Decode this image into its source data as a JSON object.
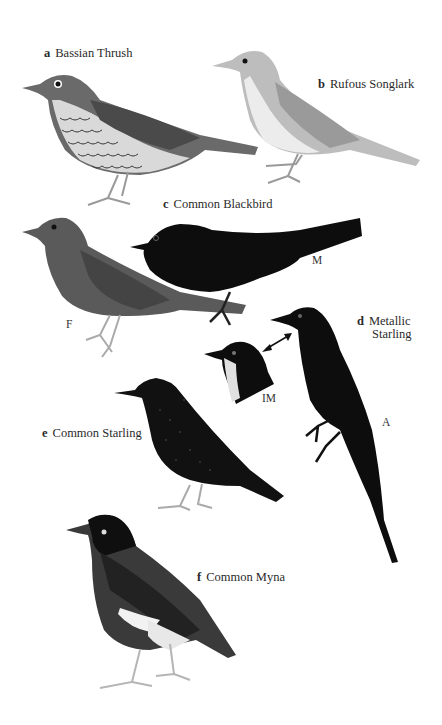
{
  "plate": {
    "species": [
      {
        "letter": "a",
        "name": "Bassian Thrush"
      },
      {
        "letter": "b",
        "name": "Rufous Songlark"
      },
      {
        "letter": "c",
        "name": "Common Blackbird"
      },
      {
        "letter": "d",
        "name_line1": "Metallic",
        "name_line2": "Starling"
      },
      {
        "letter": "e",
        "name": "Common Starling"
      },
      {
        "letter": "f",
        "name": "Common Myna"
      }
    ],
    "tags": {
      "blackbird_male": "M",
      "blackbird_female": "F",
      "starling_immature": "IM",
      "starling_adult": "A"
    }
  }
}
